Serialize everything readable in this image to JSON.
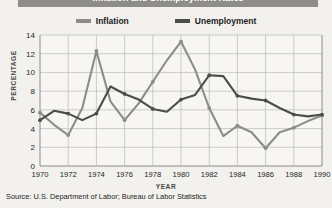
{
  "title": "Inflation and Unemployment Rates",
  "legend": [
    {
      "label": "Inflation",
      "color": "#8d8c89"
    },
    {
      "label": "Unemployment",
      "color": "#4c4c4a"
    }
  ],
  "source_note": "Source: U.S. Department of Labor; Bureau of Labor Statistics",
  "axis": {
    "xlabel": "YEAR",
    "ylabel": "PERCENTAGE",
    "y_ticks": [
      "0",
      "2",
      "4",
      "6",
      "8",
      "10",
      "12",
      "14"
    ],
    "x_ticks": [
      "1970",
      "1972",
      "1974",
      "1976",
      "1978",
      "1980",
      "1982",
      "1984",
      "1986",
      "1988",
      "1990"
    ]
  },
  "chart_data": {
    "type": "line",
    "title": "Inflation and Unemployment Rates",
    "xlabel": "YEAR",
    "ylabel": "PERCENTAGE",
    "xlim": [
      1970,
      1990
    ],
    "ylim": [
      0,
      14
    ],
    "grid": true,
    "legend_position": "top-center",
    "x": [
      1970,
      1971,
      1972,
      1973,
      1974,
      1975,
      1976,
      1977,
      1978,
      1979,
      1980,
      1981,
      1982,
      1983,
      1984,
      1985,
      1986,
      1987,
      1988,
      1989,
      1990
    ],
    "series": [
      {
        "name": "Inflation",
        "color": "#8d8c89",
        "values": [
          5.7,
          4.4,
          3.3,
          6.2,
          12.3,
          6.9,
          4.9,
          6.7,
          9.0,
          11.3,
          13.3,
          10.3,
          6.2,
          3.2,
          4.3,
          3.6,
          1.9,
          3.6,
          4.1,
          4.8,
          5.4
        ]
      },
      {
        "name": "Unemployment",
        "color": "#4c4c4a",
        "values": [
          4.9,
          5.9,
          5.6,
          4.9,
          5.6,
          8.5,
          7.7,
          7.1,
          6.1,
          5.8,
          7.1,
          7.6,
          9.7,
          9.6,
          7.5,
          7.2,
          7.0,
          6.2,
          5.5,
          5.3,
          5.5
        ]
      }
    ]
  }
}
